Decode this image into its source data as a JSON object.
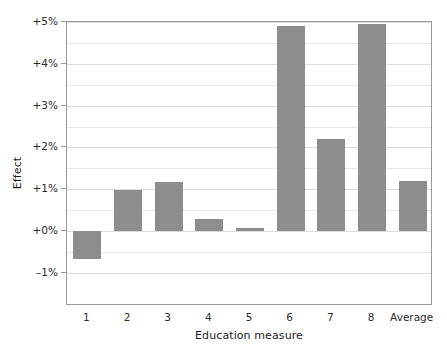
{
  "chart_data": {
    "type": "bar",
    "title": "",
    "xlabel": "Education measure",
    "ylabel": "Effect",
    "categories": [
      "1",
      "2",
      "3",
      "4",
      "5",
      "6",
      "7",
      "8",
      "Average"
    ],
    "values": [
      -0.67,
      0.99,
      1.17,
      0.28,
      0.06,
      4.9,
      2.2,
      4.95,
      1.2
    ],
    "value_unit": "%",
    "ylim": [
      -1,
      5
    ],
    "ytick_values": [
      5,
      4,
      3,
      2,
      1,
      0,
      -1
    ],
    "ytick_labels": [
      "+5%",
      "+4%",
      "+3%",
      "+2%",
      "+1%",
      "+0%",
      "–1%"
    ],
    "minor_gridline_step": 0.5,
    "grid": true,
    "legend": false,
    "bar_color": "#8d8d8d",
    "frame_color": "#9a9a9a",
    "gridline_color": "#e8e8e8",
    "text_color": "#2b2b2b",
    "background": "#ffffff"
  }
}
